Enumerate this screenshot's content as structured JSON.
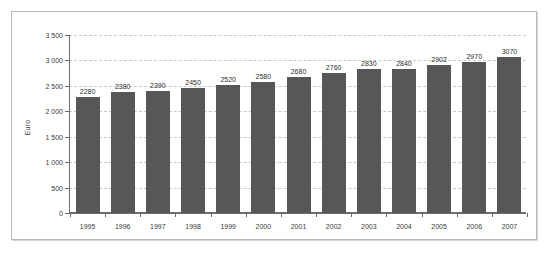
{
  "chart_data": {
    "type": "bar",
    "title": "",
    "xlabel": "",
    "ylabel": "Euro",
    "categories": [
      "1995",
      "1996",
      "1997",
      "1998",
      "1999",
      "2000",
      "2001",
      "2002",
      "2003",
      "2004",
      "2005",
      "2006",
      "2007"
    ],
    "values": [
      2280,
      2380,
      2390,
      2450,
      2520,
      2580,
      2680,
      2760,
      2830,
      2840,
      2902,
      2970,
      3070
    ],
    "value_labels": [
      "2280",
      "2380",
      "2390",
      "2450",
      "2520",
      "2580",
      "2680",
      "2760",
      "2830",
      "2840",
      "2902",
      "2970",
      "3070"
    ],
    "ylim": [
      0,
      3500
    ],
    "ytick_values": [
      0,
      500,
      1000,
      1500,
      2000,
      2500,
      3000,
      3500
    ],
    "ytick_labels": [
      "0",
      "500",
      "1 000",
      "1 500",
      "2 000",
      "2 500",
      "3 000",
      "3 500"
    ],
    "grid": true,
    "legend": false,
    "bar_color": "#575757",
    "grid_color": "#c9c9c9",
    "axis_color": "#6d6d6d",
    "frame_color": "#b9b9b9",
    "background": "#ffffff"
  }
}
